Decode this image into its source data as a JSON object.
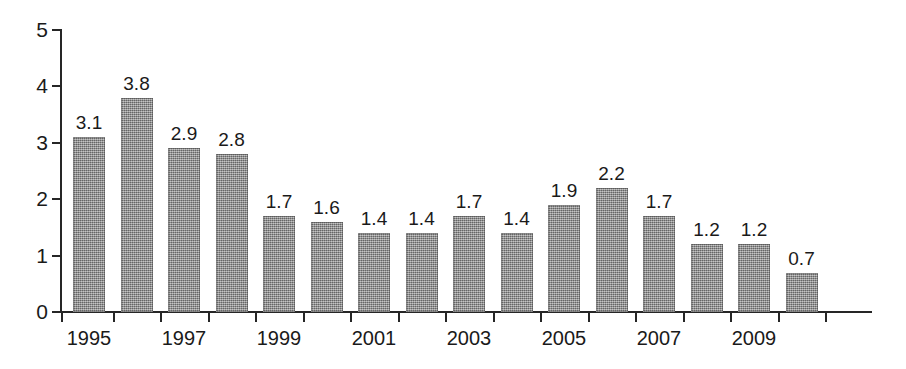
{
  "chart_data": {
    "type": "bar",
    "title": "",
    "subtitle": "",
    "xlabel": "",
    "ylabel": "",
    "categories": [
      "1995",
      "1996",
      "1997",
      "1998",
      "1999",
      "2000",
      "2001",
      "2002",
      "2003",
      "2004",
      "2005",
      "2006",
      "2007",
      "2008",
      "2009",
      "2010"
    ],
    "values": [
      3.1,
      3.8,
      2.9,
      2.8,
      1.7,
      1.6,
      1.4,
      1.4,
      1.7,
      1.4,
      1.9,
      2.2,
      1.7,
      1.2,
      1.2,
      0.7
    ],
    "value_labels": [
      "3.1",
      "3.8",
      "2.9",
      "2.8",
      "1.7",
      "1.6",
      "1.4",
      "1.4",
      "1.7",
      "1.4",
      "1.9",
      "2.2",
      "1.7",
      "1.2",
      "1.2",
      "0.7"
    ],
    "ylim": [
      0,
      5
    ],
    "y_ticks": [
      0,
      1,
      2,
      3,
      4,
      5
    ],
    "y_tick_labels": [
      "0",
      "1",
      "2",
      "3",
      "4",
      "5"
    ],
    "x_tick_labels_visible": [
      "1995",
      "1997",
      "1999",
      "2001",
      "2003",
      "2005",
      "2007",
      "2009"
    ],
    "x_tick_label_indices": [
      0,
      2,
      4,
      6,
      8,
      10,
      12,
      14
    ],
    "grid": false,
    "legend": false,
    "legend_position": "none",
    "bar_color": "#8d8d8d",
    "axis_color": "#262626",
    "background_color": "#ffffff",
    "data_labels_shown": true
  }
}
